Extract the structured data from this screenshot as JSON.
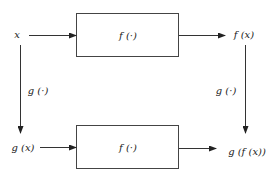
{
  "diagram": {
    "type": "commutative-diagram",
    "colors": {
      "stroke": "#333333",
      "text": "#222222",
      "background": "#ffffff"
    },
    "nodes": {
      "input": {
        "label": "x"
      },
      "top_output": {
        "label": "f (x)"
      },
      "bottom_input": {
        "label": "g (x)"
      },
      "bottom_output": {
        "label": "g (f (x))"
      }
    },
    "boxes": {
      "top": {
        "label": "f (·)"
      },
      "bottom": {
        "label": "f (·)"
      }
    },
    "edges": {
      "left_vertical": {
        "label": "g (·)"
      },
      "right_vertical": {
        "label": "g (·)"
      }
    }
  }
}
